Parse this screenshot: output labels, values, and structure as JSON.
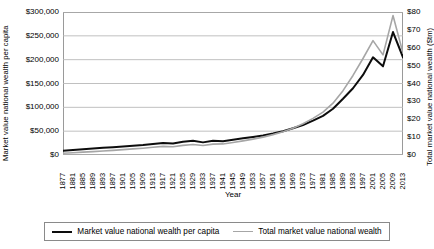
{
  "chart_data": {
    "type": "line",
    "title": "",
    "xlabel": "Year",
    "ylabel": "Market value national wealth per capita",
    "ylabel_right": "Total market value national wealth ($tm)",
    "ylim": [
      0,
      300000
    ],
    "ylim_right": [
      0,
      80
    ],
    "yticks": [
      "$0",
      "$50,000",
      "$100,000",
      "$150,000",
      "$200,000",
      "$250,000",
      "$300,000"
    ],
    "ytick_values": [
      0,
      50000,
      100000,
      150000,
      200000,
      250000,
      300000
    ],
    "yticks_right": [
      "$0",
      "$10",
      "$20",
      "$30",
      "$40",
      "$50",
      "$60",
      "$70",
      "$80"
    ],
    "ytick_values_right": [
      0,
      10,
      20,
      30,
      40,
      50,
      60,
      70,
      80
    ],
    "grid": true,
    "legend_position": "bottom",
    "xtick_labels": [
      "1877",
      "1881",
      "1885",
      "1889",
      "1893",
      "1897",
      "1901",
      "1905",
      "1909",
      "1913",
      "1917",
      "1921",
      "1925",
      "1929",
      "1933",
      "1937",
      "1941",
      "1945",
      "1949",
      "1953",
      "1957",
      "1961",
      "1965",
      "1969",
      "1973",
      "1977",
      "1981",
      "1985",
      "1989",
      "1993",
      "1997",
      "2001",
      "2005",
      "2009",
      "2013"
    ],
    "x": [
      1877,
      1881,
      1885,
      1889,
      1893,
      1897,
      1901,
      1905,
      1909,
      1913,
      1917,
      1921,
      1925,
      1929,
      1933,
      1937,
      1941,
      1945,
      1949,
      1953,
      1957,
      1961,
      1965,
      1969,
      1973,
      1977,
      1981,
      1985,
      1989,
      1993,
      1997,
      2001,
      2005,
      2009,
      2013
    ],
    "series": [
      {
        "name": "Market value national wealth per capita",
        "color": "#0d0d0d",
        "axis": "left",
        "values": [
          9000,
          10500,
          12000,
          13500,
          15000,
          16500,
          18000,
          19500,
          21000,
          23000,
          25000,
          24000,
          28000,
          30000,
          26500,
          30000,
          29000,
          32000,
          35000,
          38000,
          41000,
          45000,
          50000,
          56000,
          63000,
          72000,
          82000,
          97000,
          118000,
          140000,
          168000,
          205000,
          186000,
          258000,
          205000
        ]
      },
      {
        "name": "Total market value national wealth",
        "color": "#a6a6a6",
        "axis": "right",
        "values": [
          1.0,
          1.3,
          1.6,
          1.9,
          2.2,
          2.6,
          3.0,
          3.4,
          3.8,
          4.3,
          4.8,
          4.6,
          5.4,
          5.9,
          5.3,
          6.1,
          6.2,
          7.0,
          7.9,
          8.9,
          10.0,
          11.4,
          13.0,
          15.0,
          17.5,
          20.5,
          24.0,
          29.0,
          36.0,
          44.5,
          54.0,
          64.0,
          56.0,
          78.0,
          57.0
        ]
      }
    ]
  },
  "legend": {
    "items": [
      {
        "label": "Market value national wealth per capita"
      },
      {
        "label": "Total market value national wealth"
      }
    ]
  }
}
